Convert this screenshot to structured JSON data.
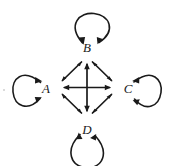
{
  "figure": {
    "kind": "directed-graph-diagram",
    "background_color": "#ffffff",
    "stroke_color": "#1a1a1a",
    "width": 174,
    "height": 166
  },
  "nodes": [
    {
      "id": "A",
      "label": "A",
      "x": 46,
      "y": 88,
      "vertex_x": 56,
      "vertex_y": 87,
      "loop_side": "left"
    },
    {
      "id": "B",
      "label": "B",
      "x": 87,
      "y": 47,
      "vertex_x": 87,
      "vertex_y": 57,
      "loop_side": "top"
    },
    {
      "id": "C",
      "label": "C",
      "x": 128,
      "y": 88,
      "vertex_x": 118,
      "vertex_y": 87,
      "loop_side": "right"
    },
    {
      "id": "D",
      "label": "D",
      "x": 87,
      "y": 129,
      "vertex_x": 87,
      "vertex_y": 118,
      "loop_side": "bottom"
    }
  ],
  "edges": [
    {
      "from": "A",
      "to": "B",
      "style": "bidirectional",
      "geometry": "diamond-side-upper-left"
    },
    {
      "from": "B",
      "to": "C",
      "style": "bidirectional",
      "geometry": "diamond-side-upper-right"
    },
    {
      "from": "C",
      "to": "D",
      "style": "bidirectional",
      "geometry": "diamond-side-lower-right"
    },
    {
      "from": "D",
      "to": "A",
      "style": "bidirectional",
      "geometry": "diamond-side-lower-left"
    },
    {
      "from": "A",
      "to": "C",
      "style": "bidirectional",
      "geometry": "horizontal-diagonal"
    },
    {
      "from": "B",
      "to": "D",
      "style": "bidirectional",
      "geometry": "vertical-diagonal"
    }
  ],
  "self_loops": [
    {
      "node": "A",
      "style": "bidirectional",
      "direction": "left"
    },
    {
      "node": "B",
      "style": "bidirectional",
      "direction": "up"
    },
    {
      "node": "C",
      "style": "bidirectional",
      "direction": "right"
    },
    {
      "node": "D",
      "style": "bidirectional",
      "direction": "down"
    }
  ]
}
